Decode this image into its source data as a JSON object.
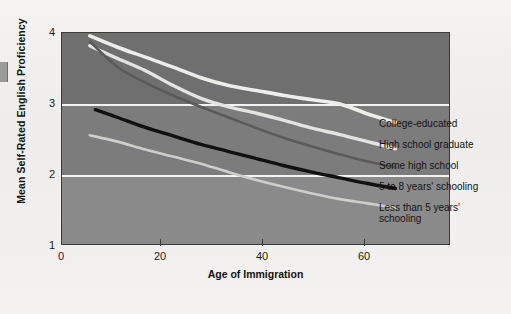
{
  "figure": {
    "background_color": "#f2f1ef",
    "plot_background_colors": [
      "#6f6f6f",
      "#7c7c7c",
      "#8a8a8a"
    ],
    "gridline_color": "#f3f3f1",
    "frame_color": "#3b3b3b"
  },
  "chart_data": {
    "type": "line",
    "title": "",
    "xlabel": "Age of Immigration",
    "ylabel": "Mean Self-Rated English Proficiency",
    "xlim": [
      0,
      70
    ],
    "ylim": [
      1,
      4
    ],
    "xticks": [
      0,
      20,
      40,
      60
    ],
    "yticks": [
      1,
      2,
      3,
      4
    ],
    "xtick_labels": [
      "0",
      "20",
      "40",
      "60"
    ],
    "ytick_labels": [
      "1",
      "2",
      "3",
      "4"
    ],
    "grid": "horizontal gridlines at y=2 and y=3",
    "legend_position": "right of plot, at line ends",
    "series": [
      {
        "name": "College-educated",
        "color": "#ededea",
        "x": [
          5,
          10,
          15,
          20,
          25,
          30,
          35,
          40,
          45,
          50,
          55,
          60
        ],
        "y": [
          3.96,
          3.8,
          3.66,
          3.52,
          3.37,
          3.26,
          3.19,
          3.12,
          3.06,
          3.0,
          2.86,
          2.74
        ]
      },
      {
        "name": "High school graduate",
        "color": "#e3e3df",
        "x": [
          5,
          10,
          15,
          20,
          25,
          30,
          35,
          40,
          45,
          50,
          55,
          60
        ],
        "y": [
          3.82,
          3.64,
          3.47,
          3.26,
          3.08,
          2.96,
          2.87,
          2.77,
          2.66,
          2.57,
          2.47,
          2.37
        ]
      },
      {
        "name": "Some high school",
        "color": "#5a5a5a",
        "x": [
          5,
          10,
          15,
          20,
          25,
          30,
          35,
          40,
          45,
          50,
          55,
          60
        ],
        "y": [
          3.88,
          3.52,
          3.3,
          3.12,
          2.96,
          2.81,
          2.66,
          2.52,
          2.4,
          2.29,
          2.19,
          2.11
        ]
      },
      {
        "name": "5 to 8 years' schooling",
        "color": "#111111",
        "x": [
          6,
          10,
          15,
          20,
          25,
          30,
          35,
          40,
          45,
          50,
          55,
          60
        ],
        "y": [
          2.92,
          2.81,
          2.67,
          2.55,
          2.43,
          2.33,
          2.23,
          2.13,
          2.04,
          1.96,
          1.88,
          1.81
        ]
      },
      {
        "name": "Less than 5 years' schooling",
        "color": "#cfcfc9",
        "x": [
          5,
          10,
          15,
          20,
          25,
          30,
          35,
          40,
          45,
          50,
          55,
          60
        ],
        "y": [
          2.56,
          2.47,
          2.36,
          2.26,
          2.16,
          2.04,
          1.93,
          1.83,
          1.74,
          1.66,
          1.6,
          1.54
        ]
      }
    ]
  },
  "legend": {
    "entries": [
      {
        "label": "College-educated"
      },
      {
        "label": "High school graduate"
      },
      {
        "label": "Some high school"
      },
      {
        "label": "5 to 8 years' schooling"
      },
      {
        "label": "Less than 5 years'\nschooling"
      }
    ]
  },
  "axes": {
    "x": {
      "label": "Age of Immigration",
      "ticks": [
        {
          "label": "0",
          "value": 0
        },
        {
          "label": "20",
          "value": 20
        },
        {
          "label": "40",
          "value": 40
        },
        {
          "label": "60",
          "value": 60
        }
      ]
    },
    "y": {
      "label": "Mean Self-Rated English Proficiency",
      "ticks": [
        {
          "label": "4",
          "value": 4
        },
        {
          "label": "3",
          "value": 3
        },
        {
          "label": "2",
          "value": 2
        },
        {
          "label": "1",
          "value": 1
        }
      ]
    }
  }
}
